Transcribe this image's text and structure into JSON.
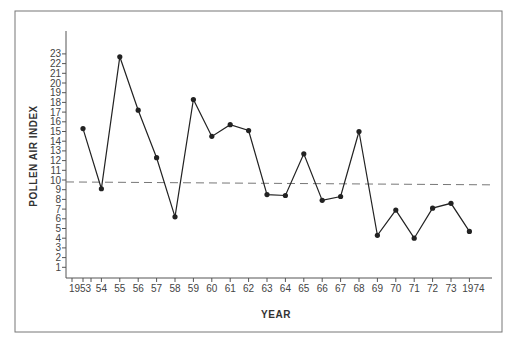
{
  "chart_data": {
    "type": "line",
    "title": "",
    "xlabel": "YEAR",
    "ylabel": "POLLEN AIR INDEX",
    "x_tick_labels": [
      "1953",
      "54",
      "55",
      "56",
      "57",
      "58",
      "59",
      "60",
      "61",
      "62",
      "63",
      "64",
      "65",
      "66",
      "67",
      "68",
      "69",
      "70",
      "71",
      "72",
      "73",
      "1974"
    ],
    "x": [
      1953,
      1954,
      1955,
      1956,
      1957,
      1958,
      1959,
      1960,
      1961,
      1962,
      1963,
      1964,
      1965,
      1966,
      1967,
      1968,
      1969,
      1970,
      1971,
      1972,
      1973,
      1974
    ],
    "series": [
      {
        "name": "Pollen Air Index",
        "values": [
          15.3,
          9.1,
          22.7,
          17.2,
          12.3,
          6.2,
          18.3,
          14.5,
          15.7,
          15.1,
          8.5,
          8.4,
          12.7,
          7.9,
          8.3,
          15.0,
          4.3,
          6.9,
          4.0,
          7.1,
          7.6,
          4.7
        ]
      }
    ],
    "trend_line": {
      "style": "dashed",
      "start_value": 9.8,
      "end_value": 9.5
    },
    "y_ticks": [
      1,
      2,
      3,
      4,
      5,
      6,
      7,
      8,
      9,
      10,
      11,
      12,
      13,
      14,
      15,
      16,
      17,
      18,
      19,
      20,
      21,
      22,
      23
    ],
    "ylim": [
      0,
      25
    ],
    "grid": false,
    "legend": "none"
  },
  "colors": {
    "line": "#222222",
    "trend": "#777777",
    "axis": "#555555",
    "frame": "#666666"
  }
}
